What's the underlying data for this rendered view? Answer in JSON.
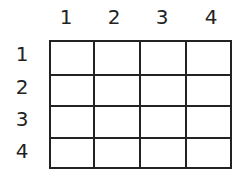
{
  "grid": {
    "columns": [
      "1",
      "2",
      "3",
      "4"
    ],
    "rows": [
      "1",
      "2",
      "3",
      "4"
    ],
    "line_color": "#222222",
    "cells": [
      [
        "",
        "",
        "",
        ""
      ],
      [
        "",
        "",
        "",
        ""
      ],
      [
        "",
        "",
        "",
        ""
      ],
      [
        "",
        "",
        "",
        ""
      ]
    ]
  }
}
